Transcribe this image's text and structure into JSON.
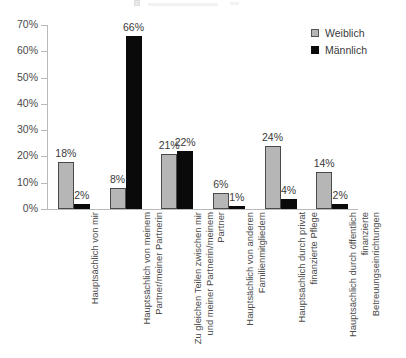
{
  "chart_data": {
    "type": "bar",
    "title": "",
    "subtitle": "",
    "xlabel": "",
    "ylabel": "",
    "ylim": [
      0,
      70
    ],
    "ytick_labels": [
      "0%",
      "10%",
      "20%",
      "30%",
      "40%",
      "50%",
      "60%",
      "70%"
    ],
    "ytick_values": [
      0,
      10,
      20,
      30,
      40,
      50,
      60,
      70
    ],
    "grid": false,
    "legend_position": "top-right",
    "categories": [
      "Hauptsächlich von mir",
      "Hauptsächlich von meinem Partner/meiner Partnerin",
      "Zu gleichen Teilen zwischen mir und meiner Partnerin/meinem Partner",
      "Hauptsächlich von anderen Familienmitgliedern",
      "Hauptsächlich durch privat finanzierte Pflege",
      "Hauptsächlich durch öffentlich finanzierte Betreuungseinrichtungen"
    ],
    "series": [
      {
        "name": "Weiblich",
        "color": "#b6b6b6",
        "values": [
          18,
          8,
          21,
          6,
          24,
          14
        ],
        "labels": [
          "18%",
          "8%",
          "21%",
          "6%",
          "24%",
          "14%"
        ]
      },
      {
        "name": "Männlich",
        "color": "#0a0a0a",
        "values": [
          2,
          66,
          22,
          1,
          4,
          2
        ],
        "labels": [
          "2%",
          "66%",
          "22%",
          "1%",
          "4%",
          "2%"
        ]
      }
    ]
  },
  "legend": {
    "items": [
      {
        "label": "Weiblich",
        "swatch": "weiblich"
      },
      {
        "label": "Männlich",
        "swatch": "maennlich"
      }
    ]
  },
  "colors": {
    "weiblich": "#b6b6b6",
    "maennlich": "#0a0a0a",
    "axis": "#b9b9b9",
    "text": "#3a3a3a",
    "background": "#ffffff"
  }
}
